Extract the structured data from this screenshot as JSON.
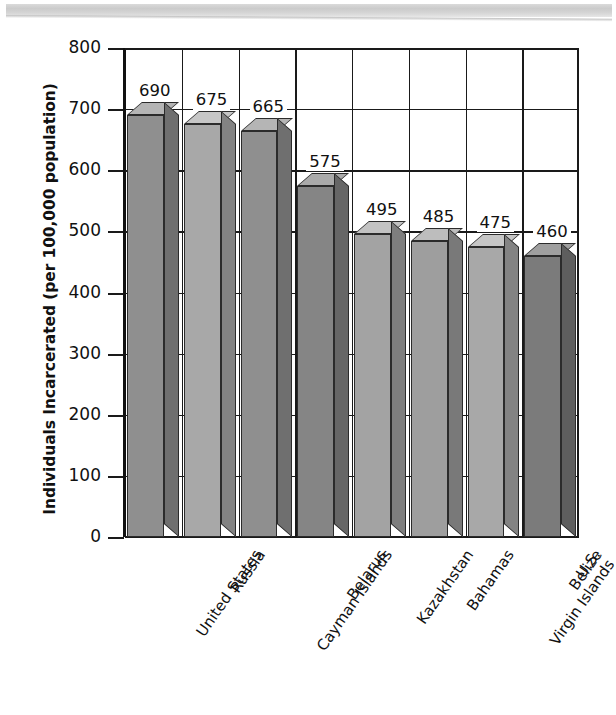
{
  "figure": {
    "scan_artifact": "scanned-page-edge-band"
  },
  "chart_data": {
    "type": "bar",
    "title": "",
    "subtitle": "",
    "xlabel": "",
    "ylabel": "Individuals Incarcerated (per 100,000 population)",
    "categories": [
      "United States",
      "Russia",
      "Cayman Islands",
      "Belarus",
      "Kazakhstan",
      "Bahamas",
      "U.S.\nVirgin Islands",
      "Belize"
    ],
    "category_lines": [
      [
        "United States"
      ],
      [
        "Russia"
      ],
      [
        "Cayman Islands"
      ],
      [
        "Belarus"
      ],
      [
        "Kazakhstan"
      ],
      [
        "Bahamas"
      ],
      [
        "U.S.",
        "Virgin Islands"
      ],
      [
        "Belize"
      ]
    ],
    "values": [
      690,
      675,
      665,
      575,
      495,
      485,
      475,
      460
    ],
    "value_labels": [
      "690",
      "675",
      "665",
      "575",
      "495",
      "485",
      "475",
      "460"
    ],
    "ylim": [
      0,
      800
    ],
    "ytick_values": [
      0,
      100,
      200,
      300,
      400,
      500,
      600,
      700,
      800
    ],
    "ytick_labels": [
      "0",
      "100",
      "200",
      "300",
      "400",
      "500",
      "600",
      "700",
      "800"
    ],
    "grid": {
      "horizontal": true,
      "vertical": true
    },
    "legend": null,
    "style": "3d-bar-grayscale",
    "bar_colors": [
      "#8f8f8f",
      "#a8a8a8",
      "#8f8f8f",
      "#858585",
      "#a3a3a3",
      "#9e9e9e",
      "#a8a8a8",
      "#7b7b7b"
    ],
    "bar_top_colors": [
      "#b5b5b5",
      "#c6c6c6",
      "#b5b5b5",
      "#aaaaaa",
      "#c2c2c2",
      "#bdbdbd",
      "#c6c6c6",
      "#9f9f9f"
    ],
    "bar_side_colors": [
      "#6f6f6f",
      "#838383",
      "#6f6f6f",
      "#666666",
      "#7e7e7e",
      "#797979",
      "#838383",
      "#5e5e5e"
    ],
    "axis_color": "#1a1a1a",
    "background_color": "#ffffff"
  }
}
